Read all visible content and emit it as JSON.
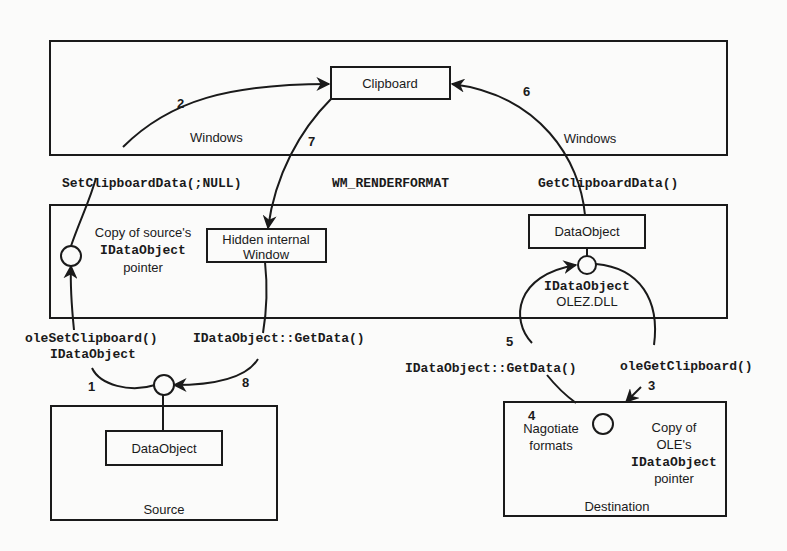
{
  "diagram": {
    "regions": {
      "windows": {
        "label": "Windows"
      },
      "ole": {
        "label": ""
      },
      "source": {
        "label": "Source"
      },
      "destination": {
        "label": "Destination"
      }
    },
    "nodes": {
      "clipboard": "Clipboard",
      "hidden_window": {
        "line1": "Hidden internal",
        "line2": "Window"
      },
      "ole_data_object": "DataObject",
      "source_data_object": "DataObject"
    },
    "annotations": {
      "source_copy": {
        "line1": "Copy of source's",
        "line2": "IDataObject",
        "line3": "pointer"
      },
      "ole_interface": {
        "line1": "IDataObject",
        "line2": "OLEZ.DLL"
      },
      "negotiate": {
        "step": "4",
        "line1": "Nagotiate",
        "line2": "formats"
      },
      "dest_copy": {
        "line1": "Copy of",
        "line2": "OLE's",
        "line3": "IDataObject",
        "line4": "pointer"
      }
    },
    "calls": {
      "set_clipboard_data": "SetClipboardData(;NULL)",
      "wm_renderformat": "WM_RENDERFORMAT",
      "get_clipboard_data": "GetClipboardData()",
      "ole_set_clipboard": {
        "line1": "oleSetClipboard()",
        "line2": "IDataObject"
      },
      "get_data_source": "IDataObject::GetData()",
      "get_data_dest": "IDataObject::GetData()",
      "ole_get_clipboard": "oleGetClipboard()"
    },
    "steps": {
      "s1": "1",
      "s2": "2",
      "s3": "3",
      "s5": "5",
      "s6": "6",
      "s7": "7",
      "s8": "8"
    }
  }
}
